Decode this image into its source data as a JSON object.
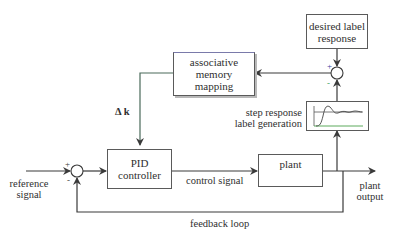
{
  "diagram": {
    "type": "control-system-block-diagram",
    "blocks": {
      "desired_label_response": "desired label\nresponse",
      "associative_memory_mapping": "associative\nmemory\nmapping",
      "pid_controller": "PID\ncontroller",
      "plant": "plant",
      "step_response_label_generation": "step response plot"
    },
    "labels": {
      "delta_k": "Δ k",
      "step_response_label_generation": "step response\nlabel generation",
      "reference_signal": "reference\nsignal",
      "control_signal": "control signal",
      "plant_output": "plant\noutput",
      "feedback_loop": "feedback loop"
    },
    "summing_junctions": {
      "input_junction": {
        "plus": "+",
        "minus": "-"
      },
      "label_junction": {
        "plus": "+",
        "minus": "-"
      }
    },
    "colors": {
      "line": "#3a3a3a",
      "plus_sign": "#3a3aa0",
      "minus_sign": "#3aa05a",
      "curve_green": "#4aa04a",
      "mapping_border_top": "#7a7aaa",
      "mapping_line_left": "#4a7a5a"
    }
  }
}
